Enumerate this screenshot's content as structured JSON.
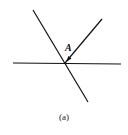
{
  "figure": {
    "point_label": "A",
    "caption": "(a)",
    "line_color": "#111111",
    "lines": [
      {
        "name": "horizontal-surface",
        "x1": 13,
        "y1": 63,
        "x2": 121,
        "y2": 64
      },
      {
        "name": "long-diagonal",
        "x1": 33,
        "y1": 10,
        "x2": 88,
        "y2": 102
      },
      {
        "name": "incident-ray",
        "x1": 102,
        "y1": 19,
        "x2": 65,
        "y2": 63
      }
    ],
    "arrow": {
      "tip_x": 66,
      "tip_y": 62,
      "direction": "toward intersection"
    }
  }
}
